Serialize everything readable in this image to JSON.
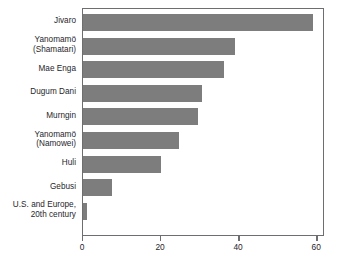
{
  "chart_data": {
    "type": "bar",
    "orientation": "horizontal",
    "title": "",
    "subtitle": "",
    "xlabel": "",
    "ylabel": "",
    "categories": [
      "Jivaro",
      "Yanomamö (Shamatari)",
      "Mae Enga",
      "Dugum Dani",
      "Murngin",
      "Yanomamö (Namowei)",
      "Huli",
      "Gebusi",
      "U.S. and Europe, 20th century"
    ],
    "category_lines": [
      [
        "Jivaro"
      ],
      [
        "Yanomamö",
        "(Shamatari)"
      ],
      [
        "Mae Enga"
      ],
      [
        "Dugum Dani"
      ],
      [
        "Murngin"
      ],
      [
        "Yanomamö",
        "(Namowei)"
      ],
      [
        "Huli"
      ],
      [
        "Gebusi"
      ],
      [
        "U.S. and Europe,",
        "20th century"
      ]
    ],
    "values": [
      59,
      39,
      36,
      30.5,
      29.5,
      24.5,
      20,
      7.5,
      1
    ],
    "xlim": [
      0,
      62
    ],
    "xticks": [
      0,
      20,
      40,
      60
    ],
    "xtick_labels": [
      "0",
      "20",
      "40",
      "60"
    ],
    "grid": false,
    "legend": "none",
    "bar_color": "#7d7d7d",
    "axis_color": "#6e6d72",
    "text_color": "#27262b",
    "background_color": "#ffffff"
  }
}
